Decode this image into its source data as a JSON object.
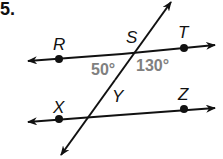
{
  "problem_number": "5.",
  "points": {
    "R": "R",
    "S": "S",
    "T": "T",
    "X": "X",
    "Y": "Y",
    "Z": "Z"
  },
  "angles": {
    "left": "50°",
    "right": "130°"
  },
  "colors": {
    "line": "#111111",
    "angle_text": "#808080"
  }
}
